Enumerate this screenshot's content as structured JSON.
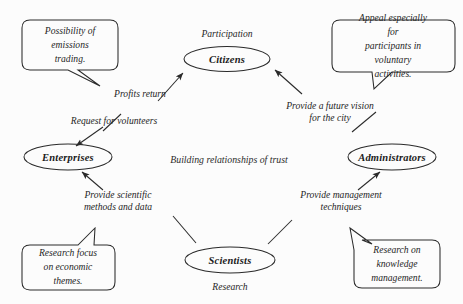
{
  "diagram": {
    "title_text": "Building relationships of trust",
    "background_color": "#fcfcfc",
    "stroke_color": "#2a2a2a",
    "nodes": [
      {
        "id": "citizens",
        "label": "Citizens",
        "role": "Participation"
      },
      {
        "id": "enterprises",
        "label": "Enterprises",
        "role": ""
      },
      {
        "id": "administrators",
        "label": "Administrators",
        "role": ""
      },
      {
        "id": "scientists",
        "label": "Scientists",
        "role": "Research"
      }
    ],
    "edges": [
      {
        "id": "enterprises-to-citizens",
        "label": "Profits return"
      },
      {
        "id": "citizens-to-enterprises",
        "label": "Request for volunteers"
      },
      {
        "id": "administrators-to-citizens",
        "label": "Provide a future vision\nfor the city"
      },
      {
        "id": "scientists-to-enterprises",
        "label": "Provide scientific\nmethods and data"
      },
      {
        "id": "scientists-to-administrators",
        "label": "Provide management\ntechniques"
      }
    ],
    "callouts": [
      {
        "id": "emissions-trading",
        "text": "Possibility of\nemissions\ntrading."
      },
      {
        "id": "voluntary-activities",
        "text": "Appeal especially for\nparticipants in\nvoluntary activities."
      },
      {
        "id": "economic-themes",
        "text": "Research focus\non economic\nthemes."
      },
      {
        "id": "knowledge-management",
        "text": "Research on\nknowledge\nmanagement."
      }
    ]
  }
}
